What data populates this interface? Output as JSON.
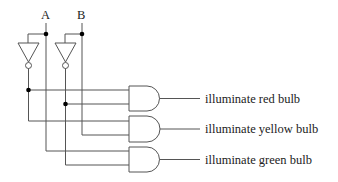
{
  "diagram": {
    "type": "logic-circuit",
    "inputs": [
      {
        "label": "A"
      },
      {
        "label": "B"
      }
    ],
    "gates": {
      "not_gates": [
        {
          "name": "NOT A",
          "input": "A"
        },
        {
          "name": "NOT B",
          "input": "B"
        }
      ],
      "and_gates": [
        {
          "inputs": [
            "NOT A",
            "NOT B"
          ],
          "output_label": "illuminate red bulb"
        },
        {
          "inputs": [
            "NOT A",
            "B"
          ],
          "output_label": "illuminate yellow bulb"
        },
        {
          "inputs": [
            "A",
            "NOT B"
          ],
          "output_label": "illuminate green bulb"
        }
      ]
    },
    "outputs": [
      {
        "label": "illuminate red bulb"
      },
      {
        "label": "illuminate yellow bulb"
      },
      {
        "label": "illuminate green bulb"
      }
    ],
    "colors": {
      "wire": "#555555",
      "junction": "#000000",
      "background": "#ffffff"
    }
  }
}
